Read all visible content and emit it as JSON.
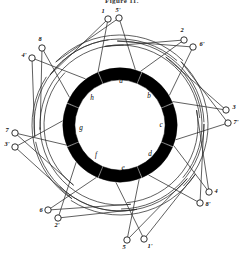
{
  "figure": {
    "caption": "Figure 11.",
    "type": "stator-winding-diagram",
    "center": {
      "x": 120,
      "y": 125
    },
    "bore_radius": 44,
    "pole_ring": {
      "inner_radius": 45,
      "outer_radius": 57,
      "count": 8,
      "gap_degrees": 13
    }
  },
  "poles": [
    {
      "letter": "a",
      "angle_deg": -90,
      "label_x": 121,
      "label_y": 83,
      "seg_start": -112,
      "seg_end": -68
    },
    {
      "letter": "b",
      "angle_deg": -45,
      "label_x": 149,
      "label_y": 98,
      "seg_start": -67,
      "seg_end": -23
    },
    {
      "letter": "c",
      "angle_deg": 0,
      "label_x": 161,
      "label_y": 127,
      "seg_start": -22,
      "seg_end": 22
    },
    {
      "letter": "d",
      "angle_deg": 45,
      "label_x": 150,
      "label_y": 156,
      "seg_start": 23,
      "seg_end": 67
    },
    {
      "letter": "e",
      "angle_deg": 90,
      "label_x": 123,
      "label_y": 170,
      "seg_start": 68,
      "seg_end": 112
    },
    {
      "letter": "f",
      "angle_deg": 135,
      "label_x": 96,
      "label_y": 157,
      "seg_start": 113,
      "seg_end": 157
    },
    {
      "letter": "g",
      "angle_deg": 180,
      "label_x": 81,
      "label_y": 130,
      "seg_start": 158,
      "seg_end": 202
    },
    {
      "letter": "h",
      "angle_deg": -135,
      "label_x": 92,
      "label_y": 100,
      "seg_start": 203,
      "seg_end": 247
    }
  ],
  "terminals": [
    {
      "id": "1",
      "label": "1",
      "cx": 108,
      "cy": 19,
      "lx": 103,
      "ly": 13,
      "coil_r": 86,
      "coil_span": 96
    },
    {
      "id": "5p",
      "label": "5'",
      "cx": 119,
      "cy": 18,
      "lx": 118,
      "ly": 12,
      "coil_r": 90,
      "coil_span": 90
    },
    {
      "id": "2",
      "label": "2",
      "cx": 184,
      "cy": 40,
      "lx": 182,
      "ly": 32,
      "coil_r": 80,
      "coil_span": 96
    },
    {
      "id": "6p",
      "label": "6'",
      "cx": 193,
      "cy": 47,
      "lx": 202,
      "ly": 46,
      "coil_r": 84,
      "coil_span": 90
    },
    {
      "id": "3",
      "label": "3",
      "cx": 226,
      "cy": 110,
      "lx": 234,
      "ly": 109,
      "coil_r": 82,
      "coil_span": 96
    },
    {
      "id": "7p",
      "label": "7'",
      "cx": 228,
      "cy": 123,
      "lx": 236,
      "ly": 124,
      "coil_r": 88,
      "coil_span": 90
    },
    {
      "id": "4",
      "label": "4",
      "cx": 209,
      "cy": 192,
      "lx": 216,
      "ly": 193,
      "coil_r": 78,
      "coil_span": 96
    },
    {
      "id": "8p",
      "label": "8'",
      "cx": 200,
      "cy": 203,
      "lx": 208,
      "ly": 206,
      "coil_r": 84,
      "coil_span": 90
    },
    {
      "id": "5",
      "label": "5",
      "cx": 127,
      "cy": 240,
      "lx": 124,
      "ly": 249,
      "coil_r": 86,
      "coil_span": 96
    },
    {
      "id": "1p",
      "label": "1'",
      "cx": 144,
      "cy": 239,
      "lx": 150,
      "ly": 248,
      "coil_r": 90,
      "coil_span": 90
    },
    {
      "id": "6",
      "label": "6",
      "cx": 48,
      "cy": 210,
      "lx": 41,
      "ly": 212,
      "coil_r": 80,
      "coil_span": 96
    },
    {
      "id": "2p",
      "label": "2'",
      "cx": 58,
      "cy": 218,
      "lx": 57,
      "ly": 227,
      "coil_r": 86,
      "coil_span": 90
    },
    {
      "id": "7",
      "label": "7",
      "cx": 15,
      "cy": 133,
      "lx": 7,
      "ly": 132,
      "coil_r": 76,
      "coil_span": 96
    },
    {
      "id": "3p",
      "label": "3'",
      "cx": 15,
      "cy": 147,
      "lx": 7,
      "ly": 146,
      "coil_r": 88,
      "coil_span": 90
    },
    {
      "id": "8",
      "label": "8",
      "cx": 42,
      "cy": 48,
      "lx": 40,
      "ly": 41,
      "coil_r": 80,
      "coil_span": 96
    },
    {
      "id": "4p",
      "label": "4'",
      "cx": 32,
      "cy": 58,
      "lx": 24,
      "ly": 57,
      "coil_r": 86,
      "coil_span": 90
    }
  ],
  "colors": {
    "pole_fill": "#000000",
    "coil_stroke": "#2b2b2b",
    "terminal_stroke": "#1a1a1a",
    "background": "#ffffff",
    "text": "#111111"
  }
}
